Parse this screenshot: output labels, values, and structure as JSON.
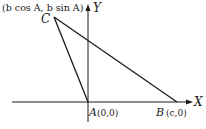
{
  "diagram": {
    "type": "coordinate-geometry-triangle",
    "axes": {
      "x_label": "X",
      "y_label": "Y"
    },
    "points": [
      {
        "name": "A",
        "coords": "(0,0)"
      },
      {
        "name": "B",
        "coords": "(c,0)"
      },
      {
        "name": "C",
        "coords": "(b cos A, b sin A)"
      }
    ],
    "labels": {
      "c_coords": "(b cos A, b sin A)",
      "c_name": "C",
      "a_name": "A",
      "a_coords": "(0,0)",
      "b_name": "B",
      "b_coords": "(c,0)",
      "x_axis": "X",
      "y_axis": "Y"
    },
    "colors": {
      "ink": "#1a1a1a",
      "background": "#ffffff"
    }
  }
}
